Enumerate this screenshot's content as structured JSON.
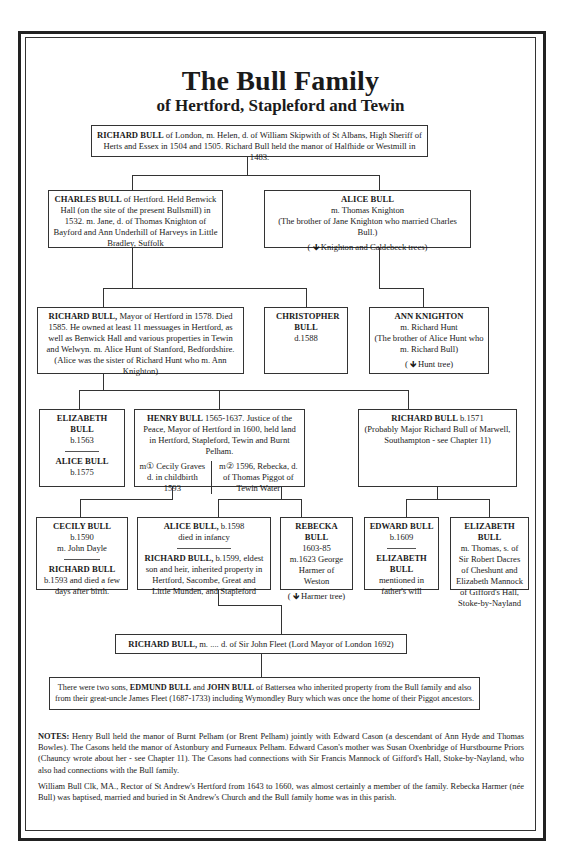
{
  "title": "The Bull Family",
  "subtitle": "of Hertford, Stapleford and Tewin",
  "gen1": {
    "richard_london": {
      "name": "RICHARD BULL",
      "text": " of London, m. Helen, d. of William Skipwith of St Albans, High Sheriff of Herts and Essex in 1504 and 1505. Richard Bull held the manor of Halfhide or Westmill in 1483."
    }
  },
  "gen2": {
    "charles": {
      "name": "CHARLES BULL",
      "text": " of Hertford. Held Benwick Hall (on the site of the present Bullsmill) in 1532. m. Jane, d. of Thomas Knighton of Bayford and Ann Underhill of Harveys in Little Bradley, Suffolk"
    },
    "alice": {
      "name": "ALICE BULL",
      "line1": "m. Thomas Knighton",
      "line2": "(The brother of Jane Knighton who married Charles Bull.)",
      "arrow": "🡻",
      "ref": " Knighton and Caldebeck trees)",
      "ref_open": "( "
    }
  },
  "gen3": {
    "richard_mayor": {
      "name": "RICHARD BULL,",
      "text": " Mayor of Hertford in 1578. Died 1585. He owned at least 11 messuages in Hertford, as well as Benwick Hall and various properties in Tewin and Welwyn. m. Alice Hunt of Stanford, Bedfordshire.",
      "note": "(Alice was the sister of Richard Hunt who m. Ann Knighton)"
    },
    "christopher": {
      "name": "CHRISTOPHER BULL",
      "dates": "d.1588"
    },
    "ann_knighton": {
      "name": "ANN KNIGHTON",
      "line1": "m. Richard Hunt",
      "line2": "(The brother of Alice Hunt who m. Richard Bull)",
      "ref_open": "( ",
      "arrow": "🡻",
      "ref": " Hunt tree)"
    }
  },
  "gen4": {
    "elizabeth_alice": {
      "name1": "ELIZABETH BULL",
      "dates1": "b.1563",
      "name2": "ALICE BULL",
      "dates2": "b.1575"
    },
    "henry": {
      "name": "HENRY BULL",
      "text": " 1565-1637. Justice of the Peace, Mayor of Hertford in 1600, held land in Hertford, Stapleford, Tewin and Burnt Pelham.",
      "marriage1": "m① Cecily Graves d. in childbirth 1593",
      "marriage2": "m② 1596, Rebecka, d. of Thomas Piggot of Tewin Water"
    },
    "richard_1571": {
      "name": "RICHARD BULL",
      "dates": " b.1571",
      "text": "(Probably Major Richard Bull of Marwell, Southampton - see Chapter 11)"
    }
  },
  "gen5": {
    "cecily_richard": {
      "name1": "CECILY BULL",
      "dates1": " b.1590",
      "line1": "m. John Dayle",
      "name2": "RICHARD BULL",
      "line2": "b.1593 and died a few days after birth."
    },
    "alice_richard": {
      "name1": "ALICE BULL,",
      "dates1": " b.1598",
      "line1": "died in infancy",
      "name2": "RICHARD BULL,",
      "line2": " b.1599, eldest son and heir, inherited property in Hertford, Sacombe, Great and Little Munden, and Stapleford"
    },
    "rebecka": {
      "name": "REBECKA BULL",
      "dates": "1603-85",
      "line1": "m.1623 George Harmer of Weston",
      "ref_open": "( ",
      "arrow": "🡻",
      "ref": " Harmer tree)"
    },
    "edward_elizabeth": {
      "name1": "EDWARD BULL",
      "dates1": "b.1609",
      "name2": "ELIZABETH BULL",
      "line2": "mentioned in father's will"
    },
    "elizabeth_dacres": {
      "name": "ELIZABETH BULL",
      "line1": "m. Thomas, s. of Sir Robert Dacres of Cheshunt and Elizabeth Mannock of Gifford's Hall, Stoke-by-Nayland"
    }
  },
  "gen6": {
    "richard_fleet": {
      "name": "RICHARD BULL,",
      "text": " m. .... d. of Sir John Fleet (Lord Mayor of London 1692)"
    }
  },
  "gen7": {
    "sons": {
      "pre": "There were two sons, ",
      "name1": "EDMUND BULL",
      "mid": " and ",
      "name2": "JOHN BULL",
      "text": " of Battersea who inherited property from the Bull family and also from their great-uncle James Fleet (1687-1733) including Wymondley Bury which was once the home of their Piggot ancestors."
    }
  },
  "notes": {
    "label": "NOTES:",
    "p1": "  Henry Bull held the manor of Burnt Pelham (or Brent Pelham) jointly with Edward Cason (a descendant of Ann Hyde and Thomas Bowles). The Casons held the manor of Astonbury and Furneaux Pelham. Edward Cason's mother was Susan Oxenbridge of Hurstbourne Priors (Chauncy wrote about her - see Chapter 11). The Casons had connections with Sir Francis Mannock of Gifford's Hall, Stoke-by-Nayland, who also had connections with the Bull family.",
    "p2": "William Bull Clk, MA., Rector of St Andrew's Hertford from 1643 to 1660, was almost certainly a member of the family. Rebecka Harmer (née Bull) was baptised, married and buried in St Andrew's Church and the Bull family home was in this parish."
  }
}
